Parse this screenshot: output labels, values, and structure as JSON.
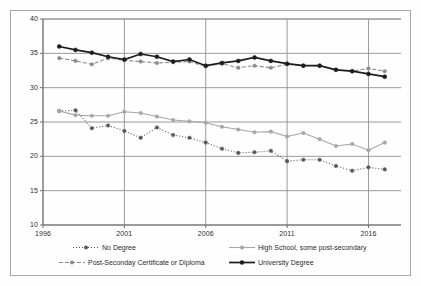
{
  "chart_data": {
    "type": "line",
    "title": "",
    "xlabel": "",
    "ylabel": "",
    "xlim": [
      1996,
      2018
    ],
    "ylim": [
      10,
      40
    ],
    "grid": true,
    "legend_position": "bottom",
    "xticks": [
      1996,
      2001,
      2006,
      2011,
      2016
    ],
    "yticks": [
      10,
      15,
      20,
      25,
      30,
      35,
      40
    ],
    "x": [
      1997,
      1998,
      1999,
      2000,
      2001,
      2002,
      2003,
      2004,
      2005,
      2006,
      2007,
      2008,
      2009,
      2010,
      2011,
      2012,
      2013,
      2014,
      2015,
      2016,
      2017
    ],
    "series": [
      {
        "name": "No Degree",
        "color": "#5a5a5a",
        "line_style": "dotted",
        "marker": "circle",
        "values": [
          26.6,
          26.7,
          24.1,
          24.5,
          23.7,
          22.7,
          24.2,
          23.1,
          22.7,
          22.0,
          21.1,
          20.5,
          20.6,
          20.8,
          19.3,
          19.5,
          19.5,
          18.6,
          17.9,
          18.4,
          18.1
        ]
      },
      {
        "name": "High School, some post-secondary",
        "color": "#a6a6a6",
        "line_style": "solid",
        "marker": "circle",
        "values": [
          26.6,
          26.0,
          25.9,
          25.9,
          26.5,
          26.3,
          25.8,
          25.3,
          25.1,
          24.9,
          24.3,
          23.9,
          23.5,
          23.6,
          22.9,
          23.4,
          22.5,
          21.5,
          21.8,
          20.9,
          22.0
        ]
      },
      {
        "name": "Post-Seconday Certificate or Diploma",
        "color": "#8c8c8c",
        "line_style": "dashed",
        "marker": "circle",
        "values": [
          34.3,
          33.9,
          33.4,
          34.3,
          34.0,
          33.8,
          33.6,
          33.7,
          33.8,
          33.1,
          33.5,
          32.9,
          33.2,
          32.9,
          33.4,
          33.2,
          33.2,
          32.6,
          32.4,
          32.8,
          32.4
        ]
      },
      {
        "name": "University Degree",
        "color": "#1c1c1c",
        "line_style": "solid",
        "marker": "circle",
        "values": [
          36.0,
          35.5,
          35.1,
          34.5,
          34.1,
          34.9,
          34.5,
          33.8,
          34.1,
          33.2,
          33.6,
          33.9,
          34.4,
          33.9,
          33.5,
          33.2,
          33.2,
          32.6,
          32.4,
          32.0,
          31.6
        ]
      }
    ]
  }
}
